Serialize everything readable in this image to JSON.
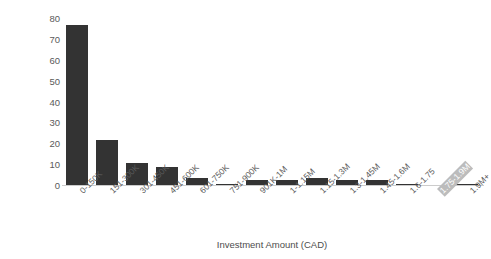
{
  "chart_data": {
    "type": "bar",
    "title": "",
    "xlabel": "Investment Amount (CAD)",
    "ylabel": "# investments",
    "categories": [
      "0-150K",
      "151-300K",
      "301-450K",
      "451-600K",
      "601-750K",
      "751-900K",
      "901K-1M",
      "1-1.15M",
      "1.15-1.3M",
      "1.3-1.45M",
      "1.45-1.6M",
      "1.6-1.75",
      "1.75-1.9M",
      "1.9M+"
    ],
    "values": [
      77,
      22,
      11,
      9,
      4,
      1,
      3,
      3,
      4,
      3,
      3,
      1,
      0,
      1
    ],
    "ylim": [
      0,
      80
    ],
    "yticks": [
      0,
      10,
      20,
      30,
      40,
      50,
      60,
      70,
      80
    ],
    "ytick_labels": [
      "0",
      "10",
      "20",
      "30",
      "40",
      "50",
      "60",
      "70",
      "80"
    ],
    "grid": false,
    "legend": false,
    "bar_color": "#333333",
    "axis_color": "#cccccc",
    "text_color": "#5a5a5a",
    "background": "#ffffff",
    "highlighted_category": "1.75-1.9M",
    "highlight_color": "#bcbcbc"
  }
}
